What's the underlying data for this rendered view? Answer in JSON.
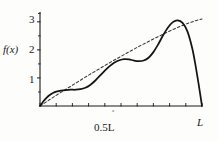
{
  "chart_data": {
    "type": "line",
    "title": "",
    "xlabel": "x",
    "ylabel": "f(x)",
    "grid": false,
    "legend": "none",
    "xlim": [
      0,
      1
    ],
    "ylim": [
      0,
      3.35
    ],
    "x_tick_labels": [
      "0.5L",
      "L"
    ],
    "x_tick_values": [
      0.5,
      1.0
    ],
    "x_minor_tick_count": 10,
    "y_tick_labels": [
      "1",
      "2",
      "3"
    ],
    "y_tick_values": [
      1,
      2,
      3
    ],
    "y_minor_tick_count": 7,
    "series": [
      {
        "name": "f(x)",
        "style": "solid",
        "color": "#151515",
        "x": [
          0.0,
          0.02,
          0.04,
          0.06,
          0.08,
          0.1,
          0.13,
          0.16,
          0.19,
          0.22,
          0.25,
          0.28,
          0.31,
          0.34,
          0.37,
          0.4,
          0.43,
          0.46,
          0.49,
          0.52,
          0.55,
          0.58,
          0.61,
          0.64,
          0.67,
          0.7,
          0.73,
          0.76,
          0.79,
          0.82,
          0.85,
          0.88,
          0.91,
          0.94,
          0.96,
          0.98,
          1.0
        ],
        "y": [
          0.0,
          0.16,
          0.29,
          0.39,
          0.46,
          0.51,
          0.55,
          0.57,
          0.58,
          0.58,
          0.6,
          0.65,
          0.75,
          0.9,
          1.08,
          1.26,
          1.42,
          1.55,
          1.63,
          1.67,
          1.66,
          1.62,
          1.6,
          1.62,
          1.72,
          1.92,
          2.2,
          2.52,
          2.8,
          2.99,
          3.05,
          2.96,
          2.66,
          2.05,
          1.45,
          0.75,
          0.0
        ]
      },
      {
        "name": "reference-trend",
        "style": "dashed",
        "color": "#3a3a3a",
        "x": [
          0.0,
          0.05,
          0.1,
          0.15,
          0.2,
          0.25,
          0.3,
          0.35,
          0.4,
          0.45,
          0.5,
          0.55,
          0.6,
          0.65,
          0.7,
          0.75,
          0.8,
          0.85,
          0.9,
          0.95,
          1.0
        ],
        "y": [
          0.0,
          0.19,
          0.38,
          0.56,
          0.74,
          0.92,
          1.1,
          1.27,
          1.44,
          1.61,
          1.77,
          1.93,
          2.09,
          2.24,
          2.39,
          2.53,
          2.67,
          2.8,
          2.92,
          3.02,
          3.1
        ]
      }
    ],
    "annotations": []
  },
  "axes": {
    "y_axis_label": "f(x)",
    "y_ticks": [
      "3",
      "2",
      "1"
    ],
    "x_tick_mid": "0.5L",
    "x_tick_end": "L",
    "x_var_marker": "x"
  },
  "colors": {
    "background": "#fdfdfc",
    "axis": "#1a1a1a",
    "curve_solid": "#151515",
    "curve_dashed": "#3a3a3a",
    "text": "#1a1a1a"
  }
}
